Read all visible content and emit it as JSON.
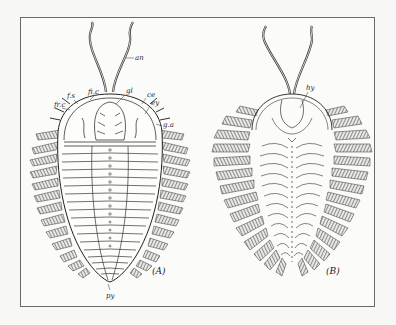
{
  "figure": {
    "panels": [
      {
        "id": "A",
        "caption": "(A)",
        "view": "dorsal",
        "labels": {
          "antenna": "an",
          "glabella": "gl",
          "cheek": "ce",
          "eye": "ey",
          "genal_angle": "g.a",
          "fixed_cheek": "fi.c",
          "facial_suture": "f.s",
          "free_cheek": "fr.c",
          "pygidium": "py"
        }
      },
      {
        "id": "B",
        "caption": "(B)",
        "view": "ventral",
        "labels": {
          "hypostome": "hy"
        }
      }
    ]
  }
}
